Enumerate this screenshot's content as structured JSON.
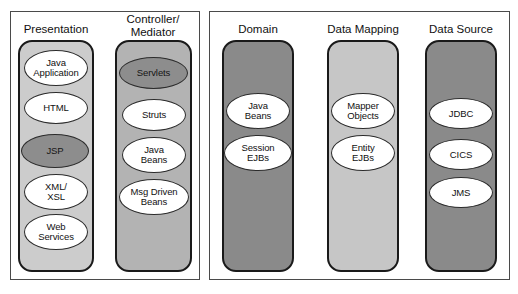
{
  "diagram": {
    "colors": {
      "page_background": "#ffffff",
      "panel_border": "#4a4a4a",
      "column_border": "#1a1a1a",
      "presentation_fill": "#cccccc",
      "controller_fill": "#b3b3b3",
      "domain_fill": "#8a8a8a",
      "data_mapping_fill": "#c6c6c6",
      "data_source_fill": "#8a8a8a",
      "node_fill": "#ffffff",
      "node_highlight_fill": "#8d8d8d",
      "connector": "#222222"
    },
    "panels": [
      {
        "id": "client-tier-panel",
        "x": 10,
        "y": 11,
        "width": 190,
        "height": 269,
        "columns": [
          {
            "id": "presentation",
            "label": "Presentation",
            "label_x": 18,
            "label_y": 23,
            "label_width": 76,
            "x": 18,
            "y": 40,
            "width": 76,
            "height": 232,
            "fill": "#cccccc",
            "nodes": [
              {
                "id": "java-application",
                "label": "Java\nApplication",
                "x": 24,
                "y": 50,
                "width": 64,
                "height": 36,
                "highlight": false
              },
              {
                "id": "html",
                "label": "HTML",
                "x": 24,
                "y": 92,
                "width": 64,
                "height": 32,
                "highlight": false
              },
              {
                "id": "jsp",
                "label": "JSP",
                "x": 21,
                "y": 134,
                "width": 68,
                "height": 34,
                "highlight": true
              },
              {
                "id": "xml-xsl",
                "label": "XML/\nXSL",
                "x": 24,
                "y": 174,
                "width": 64,
                "height": 36,
                "highlight": false
              },
              {
                "id": "web-services",
                "label": "Web\nServices",
                "x": 24,
                "y": 214,
                "width": 64,
                "height": 36,
                "highlight": false
              }
            ]
          },
          {
            "id": "controller-mediator",
            "label": "Controller/\nMediator",
            "label_x": 113,
            "label_y": 13,
            "label_width": 80,
            "x": 115,
            "y": 40,
            "width": 77,
            "height": 232,
            "fill": "#b3b3b3",
            "nodes": [
              {
                "id": "servlets",
                "label": "Servlets",
                "x": 119,
                "y": 57,
                "width": 69,
                "height": 32,
                "highlight": true
              },
              {
                "id": "struts",
                "label": "Struts",
                "x": 122,
                "y": 99,
                "width": 64,
                "height": 32,
                "highlight": false
              },
              {
                "id": "java-beans-controller",
                "label": "Java\nBeans",
                "x": 122,
                "y": 137,
                "width": 64,
                "height": 36,
                "highlight": false
              },
              {
                "id": "msg-driven-beans",
                "label": "Msg Driven\nBeans",
                "x": 119,
                "y": 179,
                "width": 70,
                "height": 36,
                "highlight": false
              }
            ]
          }
        ]
      },
      {
        "id": "server-tier-panel",
        "x": 209,
        "y": 11,
        "width": 301,
        "height": 269,
        "columns": [
          {
            "id": "domain",
            "label": "Domain",
            "label_x": 222,
            "label_y": 23,
            "label_width": 72,
            "x": 222,
            "y": 40,
            "width": 72,
            "height": 232,
            "fill": "#8a8a8a",
            "nodes": [
              {
                "id": "java-beans-domain",
                "label": "Java\nBeans",
                "x": 226,
                "y": 93,
                "width": 64,
                "height": 36,
                "highlight": false
              },
              {
                "id": "session-ejbs",
                "label": "Session\nEJBs",
                "x": 224,
                "y": 135,
                "width": 68,
                "height": 36,
                "highlight": false
              }
            ]
          },
          {
            "id": "data-mapping",
            "label": "Data Mapping",
            "label_x": 326,
            "label_y": 23,
            "label_width": 74,
            "x": 327,
            "y": 40,
            "width": 72,
            "height": 232,
            "fill": "#c6c6c6",
            "nodes": [
              {
                "id": "mapper-objects",
                "label": "Mapper\nObjects",
                "x": 331,
                "y": 93,
                "width": 64,
                "height": 36,
                "highlight": false
              },
              {
                "id": "entity-ejbs",
                "label": "Entity\nEJBs",
                "x": 331,
                "y": 135,
                "width": 64,
                "height": 36,
                "highlight": false
              }
            ]
          },
          {
            "id": "data-source",
            "label": "Data Source",
            "label_x": 424,
            "label_y": 23,
            "label_width": 74,
            "x": 425,
            "y": 40,
            "width": 72,
            "height": 232,
            "fill": "#8a8a8a",
            "nodes": [
              {
                "id": "jdbc",
                "label": "JDBC",
                "x": 429,
                "y": 98,
                "width": 64,
                "height": 31,
                "highlight": false
              },
              {
                "id": "cics",
                "label": "CICS",
                "x": 429,
                "y": 139,
                "width": 64,
                "height": 31,
                "highlight": false
              },
              {
                "id": "jms",
                "label": "JMS",
                "x": 429,
                "y": 177,
                "width": 64,
                "height": 31,
                "highlight": false
              }
            ]
          }
        ]
      }
    ],
    "connectors": [
      {
        "id": "jsp-to-servlets",
        "from": "jsp",
        "to": "servlets",
        "x1": 87,
        "y1": 152,
        "x2": 119,
        "y2": 73,
        "endpoint_radius": 3.2
      }
    ]
  }
}
